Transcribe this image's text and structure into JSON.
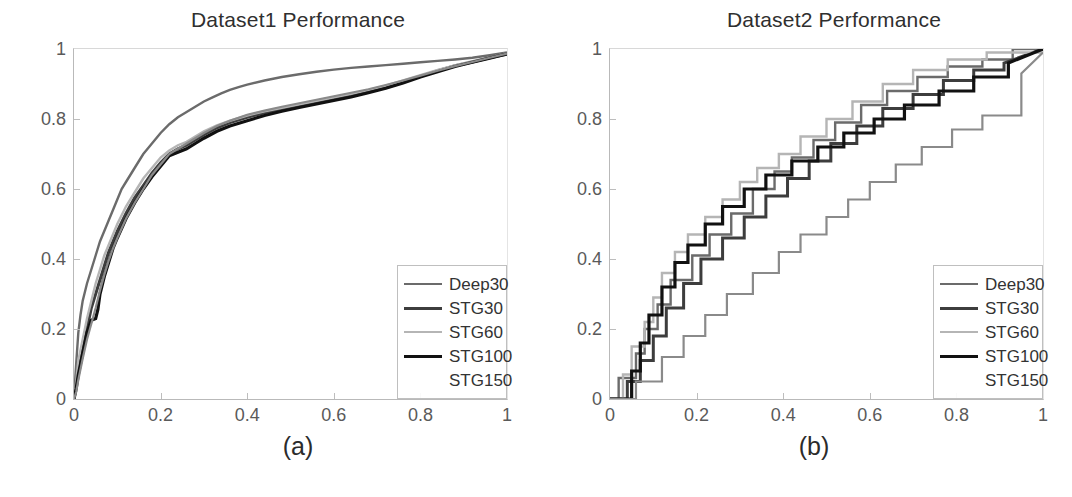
{
  "figure": {
    "background": "#ffffff",
    "panels": [
      {
        "id": "a",
        "caption": "(a)",
        "title": "Dataset1 Performance",
        "legend_position": "bottom-right"
      },
      {
        "id": "b",
        "caption": "(b)",
        "title": "Dataset2 Performance",
        "legend_position": "bottom-right"
      }
    ]
  },
  "series_style": {
    "Deep30": "#6b6b6b",
    "STG30": "#3d3d3d",
    "STG60": "#b5b5b5",
    "STG100": "#111111",
    "STG150": "#8a8a8a"
  },
  "legend": {
    "entries": [
      {
        "label": "Deep30",
        "color": "#6b6b6b",
        "width": 2.4,
        "dash": "none"
      },
      {
        "label": "STG30",
        "color": "#3d3d3d",
        "width": 3.0,
        "dash": "none"
      },
      {
        "label": "STG60",
        "color": "#b5b5b5",
        "width": 2.4,
        "dash": "none"
      },
      {
        "label": "STG100",
        "color": "#111111",
        "width": 3.2,
        "dash": "none"
      },
      {
        "label": "STG150",
        "color": "#8a8a8a",
        "width": 0,
        "dash": "none"
      }
    ]
  },
  "chart_data": [
    {
      "type": "line",
      "title": "Dataset1 Performance",
      "subtitle": "",
      "caption": "(a)",
      "xlabel": "",
      "ylabel": "",
      "xlim": [
        0,
        1
      ],
      "ylim": [
        0,
        1
      ],
      "xticks": [
        "0",
        "0.2",
        "0.4",
        "0.6",
        "0.8",
        "1"
      ],
      "xtick_values": [
        0,
        0.2,
        0.4,
        0.6,
        0.8,
        1
      ],
      "yticks": [
        "0",
        "0.2",
        "0.4",
        "0.6",
        "0.8",
        "1"
      ],
      "ytick_values": [
        0,
        0.2,
        0.4,
        0.6,
        0.8,
        1
      ],
      "grid": false,
      "legend_position": "lower right",
      "legend_entries": [
        "Deep30",
        "STG30",
        "STG60",
        "STG100",
        "STG150"
      ],
      "series": [
        {
          "name": "Deep30",
          "color": "#6b6b6b",
          "x": [
            0,
            0.005,
            0.01,
            0.015,
            0.02,
            0.03,
            0.04,
            0.05,
            0.06,
            0.07,
            0.08,
            0.09,
            0.1,
            0.11,
            0.12,
            0.13,
            0.14,
            0.15,
            0.16,
            0.17,
            0.18,
            0.19,
            0.2,
            0.22,
            0.24,
            0.26,
            0.28,
            0.3,
            0.32,
            0.34,
            0.36,
            0.38,
            0.4,
            0.44,
            0.48,
            0.52,
            0.56,
            0.6,
            0.64,
            0.68,
            0.72,
            0.76,
            0.8,
            0.84,
            0.88,
            0.92,
            0.96,
            1.0
          ],
          "y": [
            0,
            0.1,
            0.19,
            0.24,
            0.28,
            0.33,
            0.37,
            0.41,
            0.45,
            0.48,
            0.51,
            0.54,
            0.57,
            0.6,
            0.62,
            0.64,
            0.66,
            0.68,
            0.7,
            0.715,
            0.73,
            0.745,
            0.76,
            0.785,
            0.805,
            0.82,
            0.835,
            0.85,
            0.862,
            0.873,
            0.883,
            0.891,
            0.898,
            0.91,
            0.92,
            0.928,
            0.935,
            0.941,
            0.946,
            0.95,
            0.954,
            0.958,
            0.962,
            0.966,
            0.97,
            0.975,
            0.982,
            0.99
          ]
        },
        {
          "name": "STG30",
          "color": "#3d3d3d",
          "x": [
            0,
            0.005,
            0.01,
            0.02,
            0.03,
            0.04,
            0.05,
            0.06,
            0.07,
            0.08,
            0.09,
            0.1,
            0.12,
            0.14,
            0.16,
            0.18,
            0.2,
            0.22,
            0.24,
            0.26,
            0.28,
            0.3,
            0.33,
            0.36,
            0.4,
            0.44,
            0.48,
            0.52,
            0.56,
            0.6,
            0.64,
            0.68,
            0.72,
            0.76,
            0.8,
            0.84,
            0.88,
            0.92,
            0.96,
            1.0
          ],
          "y": [
            0,
            0.04,
            0.09,
            0.15,
            0.2,
            0.26,
            0.3,
            0.34,
            0.38,
            0.42,
            0.45,
            0.48,
            0.53,
            0.575,
            0.61,
            0.645,
            0.675,
            0.7,
            0.715,
            0.725,
            0.74,
            0.755,
            0.775,
            0.79,
            0.805,
            0.818,
            0.828,
            0.838,
            0.848,
            0.858,
            0.868,
            0.878,
            0.89,
            0.905,
            0.922,
            0.938,
            0.952,
            0.963,
            0.975,
            0.985
          ]
        },
        {
          "name": "STG60",
          "color": "#b5b5b5",
          "x": [
            0,
            0.005,
            0.01,
            0.02,
            0.03,
            0.04,
            0.05,
            0.06,
            0.07,
            0.08,
            0.09,
            0.1,
            0.12,
            0.14,
            0.16,
            0.18,
            0.2,
            0.22,
            0.24,
            0.26,
            0.28,
            0.3,
            0.33,
            0.36,
            0.4,
            0.44,
            0.48,
            0.52,
            0.56,
            0.6,
            0.64,
            0.68,
            0.72,
            0.76,
            0.8,
            0.84,
            0.88,
            0.92,
            0.96,
            1.0
          ],
          "y": [
            0,
            0.05,
            0.11,
            0.17,
            0.23,
            0.28,
            0.33,
            0.37,
            0.41,
            0.44,
            0.47,
            0.5,
            0.55,
            0.59,
            0.63,
            0.66,
            0.69,
            0.71,
            0.725,
            0.735,
            0.75,
            0.765,
            0.782,
            0.795,
            0.81,
            0.822,
            0.832,
            0.842,
            0.852,
            0.862,
            0.872,
            0.883,
            0.895,
            0.91,
            0.925,
            0.94,
            0.953,
            0.965,
            0.976,
            0.988
          ]
        },
        {
          "name": "STG100",
          "color": "#111111",
          "x": [
            0,
            0.005,
            0.01,
            0.02,
            0.03,
            0.04,
            0.05,
            0.055,
            0.06,
            0.07,
            0.08,
            0.09,
            0.1,
            0.12,
            0.14,
            0.16,
            0.18,
            0.2,
            0.22,
            0.24,
            0.26,
            0.28,
            0.3,
            0.33,
            0.36,
            0.4,
            0.44,
            0.48,
            0.52,
            0.56,
            0.6,
            0.64,
            0.68,
            0.72,
            0.76,
            0.8,
            0.84,
            0.88,
            0.92,
            0.96,
            1.0
          ],
          "y": [
            0,
            0.03,
            0.07,
            0.13,
            0.19,
            0.225,
            0.23,
            0.255,
            0.3,
            0.35,
            0.39,
            0.43,
            0.46,
            0.515,
            0.56,
            0.6,
            0.635,
            0.665,
            0.695,
            0.705,
            0.715,
            0.73,
            0.745,
            0.765,
            0.78,
            0.795,
            0.81,
            0.822,
            0.833,
            0.843,
            0.853,
            0.863,
            0.875,
            0.888,
            0.903,
            0.92,
            0.935,
            0.95,
            0.962,
            0.974,
            0.986
          ]
        },
        {
          "name": "STG150",
          "color": "#8a8a8a",
          "x": [
            0,
            0.005,
            0.01,
            0.02,
            0.03,
            0.04,
            0.05,
            0.06,
            0.07,
            0.08,
            0.09,
            0.1,
            0.12,
            0.14,
            0.16,
            0.18,
            0.2,
            0.22,
            0.24,
            0.26,
            0.28,
            0.3,
            0.33,
            0.36,
            0.4,
            0.44,
            0.48,
            0.52,
            0.56,
            0.6,
            0.64,
            0.68,
            0.72,
            0.76,
            0.8,
            0.84,
            0.88,
            0.92,
            0.96,
            1.0
          ],
          "y": [
            0,
            0.02,
            0.055,
            0.115,
            0.17,
            0.215,
            0.26,
            0.31,
            0.355,
            0.395,
            0.43,
            0.46,
            0.515,
            0.56,
            0.6,
            0.64,
            0.67,
            0.7,
            0.715,
            0.73,
            0.745,
            0.76,
            0.78,
            0.795,
            0.812,
            0.824,
            0.835,
            0.845,
            0.855,
            0.865,
            0.875,
            0.885,
            0.897,
            0.91,
            0.924,
            0.938,
            0.951,
            0.963,
            0.975,
            0.987
          ]
        }
      ]
    },
    {
      "type": "line",
      "title": "Dataset2 Performance",
      "subtitle": "",
      "caption": "(b)",
      "xlabel": "",
      "ylabel": "",
      "xlim": [
        0,
        1
      ],
      "ylim": [
        0,
        1
      ],
      "xticks": [
        "0",
        "0.2",
        "0.4",
        "0.6",
        "0.8",
        "1"
      ],
      "xtick_values": [
        0,
        0.2,
        0.4,
        0.6,
        0.8,
        1
      ],
      "yticks": [
        "0",
        "0.2",
        "0.4",
        "0.6",
        "0.8",
        "1"
      ],
      "ytick_values": [
        0,
        0.2,
        0.4,
        0.6,
        0.8,
        1
      ],
      "grid": false,
      "step": true,
      "legend_position": "lower right",
      "legend_entries": [
        "Deep30",
        "STG30",
        "STG60",
        "STG100",
        "STG150"
      ],
      "series": [
        {
          "name": "Deep30",
          "color": "#6b6b6b",
          "x": [
            0,
            0.02,
            0.02,
            0.06,
            0.06,
            0.08,
            0.08,
            0.11,
            0.11,
            0.14,
            0.14,
            0.19,
            0.19,
            0.23,
            0.23,
            0.28,
            0.28,
            0.33,
            0.33,
            0.38,
            0.38,
            0.42,
            0.42,
            0.47,
            0.47,
            0.52,
            0.52,
            0.58,
            0.58,
            0.64,
            0.64,
            0.71,
            0.71,
            0.78,
            0.78,
            0.86,
            0.86,
            0.93,
            0.93,
            1.0
          ],
          "y": [
            0,
            0,
            0.06,
            0.06,
            0.13,
            0.13,
            0.2,
            0.2,
            0.27,
            0.27,
            0.34,
            0.34,
            0.41,
            0.41,
            0.47,
            0.47,
            0.53,
            0.53,
            0.6,
            0.6,
            0.65,
            0.65,
            0.69,
            0.69,
            0.74,
            0.74,
            0.79,
            0.79,
            0.84,
            0.84,
            0.88,
            0.88,
            0.92,
            0.92,
            0.95,
            0.95,
            0.97,
            0.97,
            1.0,
            1.0
          ]
        },
        {
          "name": "STG30",
          "color": "#3d3d3d",
          "x": [
            0,
            0.04,
            0.04,
            0.07,
            0.07,
            0.1,
            0.1,
            0.13,
            0.13,
            0.17,
            0.17,
            0.21,
            0.21,
            0.26,
            0.26,
            0.31,
            0.31,
            0.36,
            0.36,
            0.41,
            0.41,
            0.46,
            0.46,
            0.51,
            0.51,
            0.57,
            0.57,
            0.63,
            0.63,
            0.7,
            0.7,
            0.77,
            0.77,
            0.84,
            0.84,
            0.91,
            0.91,
            1.0
          ],
          "y": [
            0,
            0,
            0.05,
            0.05,
            0.11,
            0.11,
            0.18,
            0.18,
            0.26,
            0.26,
            0.33,
            0.33,
            0.4,
            0.4,
            0.46,
            0.46,
            0.52,
            0.52,
            0.58,
            0.58,
            0.63,
            0.63,
            0.68,
            0.68,
            0.73,
            0.73,
            0.78,
            0.78,
            0.83,
            0.83,
            0.87,
            0.87,
            0.91,
            0.91,
            0.94,
            0.94,
            0.96,
            1.0
          ]
        },
        {
          "name": "STG60",
          "color": "#b5b5b5",
          "x": [
            0,
            0.03,
            0.03,
            0.05,
            0.05,
            0.08,
            0.08,
            0.1,
            0.1,
            0.12,
            0.12,
            0.15,
            0.15,
            0.18,
            0.18,
            0.22,
            0.22,
            0.26,
            0.26,
            0.3,
            0.3,
            0.34,
            0.34,
            0.39,
            0.39,
            0.44,
            0.44,
            0.5,
            0.5,
            0.56,
            0.56,
            0.63,
            0.63,
            0.7,
            0.7,
            0.78,
            0.78,
            0.87,
            0.87,
            1.0
          ],
          "y": [
            0,
            0,
            0.07,
            0.07,
            0.15,
            0.15,
            0.22,
            0.22,
            0.29,
            0.29,
            0.36,
            0.36,
            0.42,
            0.42,
            0.47,
            0.47,
            0.52,
            0.52,
            0.57,
            0.57,
            0.62,
            0.62,
            0.66,
            0.66,
            0.7,
            0.7,
            0.75,
            0.75,
            0.8,
            0.8,
            0.85,
            0.85,
            0.9,
            0.9,
            0.94,
            0.94,
            0.97,
            0.97,
            0.99,
            0.99
          ]
        },
        {
          "name": "STG100",
          "color": "#111111",
          "x": [
            0,
            0.05,
            0.05,
            0.07,
            0.07,
            0.09,
            0.09,
            0.12,
            0.12,
            0.15,
            0.15,
            0.18,
            0.18,
            0.22,
            0.22,
            0.26,
            0.26,
            0.31,
            0.31,
            0.36,
            0.36,
            0.42,
            0.42,
            0.48,
            0.48,
            0.54,
            0.54,
            0.61,
            0.61,
            0.68,
            0.68,
            0.76,
            0.76,
            0.84,
            0.84,
            0.92,
            0.92,
            1.0
          ],
          "y": [
            0,
            0,
            0.08,
            0.08,
            0.16,
            0.16,
            0.24,
            0.24,
            0.32,
            0.32,
            0.39,
            0.39,
            0.44,
            0.44,
            0.5,
            0.5,
            0.55,
            0.55,
            0.6,
            0.6,
            0.64,
            0.64,
            0.68,
            0.68,
            0.72,
            0.72,
            0.76,
            0.76,
            0.8,
            0.8,
            0.84,
            0.84,
            0.88,
            0.88,
            0.92,
            0.92,
            0.96,
            1.0
          ]
        },
        {
          "name": "STG150",
          "color": "#8a8a8a",
          "x": [
            0,
            0.06,
            0.06,
            0.12,
            0.12,
            0.17,
            0.17,
            0.22,
            0.22,
            0.27,
            0.27,
            0.33,
            0.33,
            0.39,
            0.39,
            0.44,
            0.44,
            0.5,
            0.5,
            0.55,
            0.55,
            0.6,
            0.6,
            0.66,
            0.66,
            0.72,
            0.72,
            0.79,
            0.79,
            0.86,
            0.86,
            0.95,
            0.95,
            1.0
          ],
          "y": [
            0,
            0,
            0.05,
            0.05,
            0.12,
            0.12,
            0.18,
            0.18,
            0.24,
            0.24,
            0.3,
            0.3,
            0.36,
            0.36,
            0.42,
            0.42,
            0.47,
            0.47,
            0.52,
            0.52,
            0.57,
            0.57,
            0.62,
            0.62,
            0.67,
            0.67,
            0.72,
            0.72,
            0.77,
            0.77,
            0.81,
            0.81,
            0.93,
            0.99
          ]
        }
      ]
    }
  ]
}
